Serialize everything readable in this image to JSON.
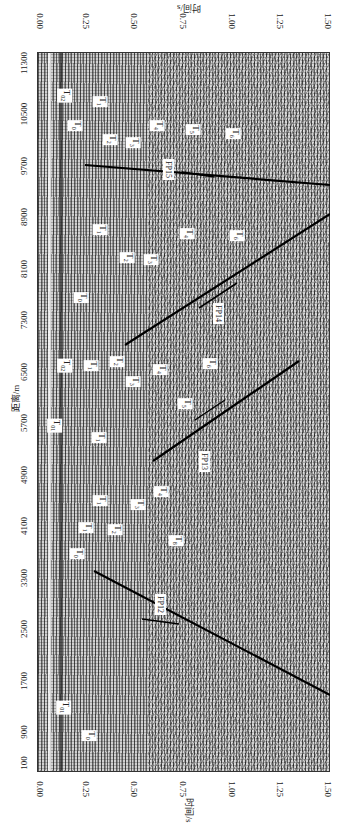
{
  "figure": {
    "x_axis": {
      "title": "距离/m",
      "ticks": [
        "11300",
        "10500",
        "9700",
        "8900",
        "8100",
        "7300",
        "6500",
        "5700",
        "4900",
        "4100",
        "3300",
        "2500",
        "1700",
        "900",
        "100"
      ]
    },
    "y_axis": {
      "title": "时间/s",
      "ticks": [
        "0.00",
        "0.25",
        "0.50",
        "0.75",
        "1.00",
        "1.25",
        "1.50"
      ]
    },
    "faults": [
      "FP15",
      "FP14",
      "FP13",
      "FP12"
    ],
    "horizons": [
      {
        "text": "T",
        "sub": "02",
        "x": 58,
        "y": 88
      },
      {
        "text": "T",
        "sub": "0",
        "x": 70,
        "y": 118
      },
      {
        "text": "T",
        "sub": "1",
        "x": 95,
        "y": 94
      },
      {
        "text": "T",
        "sub": "2",
        "x": 105,
        "y": 132
      },
      {
        "text": "T",
        "sub": "3",
        "x": 128,
        "y": 135
      },
      {
        "text": "T",
        "sub": "4",
        "x": 152,
        "y": 118
      },
      {
        "text": "T",
        "sub": "5",
        "x": 188,
        "y": 122
      },
      {
        "text": "T",
        "sub": "6",
        "x": 228,
        "y": 126
      },
      {
        "text": "T",
        "sub": "1",
        "x": 95,
        "y": 222
      },
      {
        "text": "T",
        "sub": "2",
        "x": 122,
        "y": 250
      },
      {
        "text": "T",
        "sub": "3",
        "x": 146,
        "y": 252
      },
      {
        "text": "T",
        "sub": "4",
        "x": 182,
        "y": 226
      },
      {
        "text": "T",
        "sub": "6",
        "x": 232,
        "y": 228
      },
      {
        "text": "T",
        "sub": "0",
        "x": 76,
        "y": 290
      },
      {
        "text": "T",
        "sub": "02",
        "x": 58,
        "y": 358
      },
      {
        "text": "T",
        "sub": "1",
        "x": 86,
        "y": 358
      },
      {
        "text": "T",
        "sub": "2",
        "x": 112,
        "y": 354
      },
      {
        "text": "T",
        "sub": "3",
        "x": 128,
        "y": 374
      },
      {
        "text": "T",
        "sub": "4",
        "x": 155,
        "y": 362
      },
      {
        "text": "T",
        "sub": "6",
        "x": 205,
        "y": 356
      },
      {
        "text": "T",
        "sub": "5",
        "x": 180,
        "y": 396
      },
      {
        "text": "T",
        "sub": "01",
        "x": 48,
        "y": 418
      },
      {
        "text": "T",
        "sub": "1",
        "x": 94,
        "y": 430
      },
      {
        "text": "T",
        "sub": "1",
        "x": 95,
        "y": 493
      },
      {
        "text": "T",
        "sub": "1",
        "x": 81,
        "y": 520
      },
      {
        "text": "T",
        "sub": "2",
        "x": 110,
        "y": 522
      },
      {
        "text": "T",
        "sub": "3",
        "x": 133,
        "y": 497
      },
      {
        "text": "T",
        "sub": "4",
        "x": 156,
        "y": 484
      },
      {
        "text": "T",
        "sub": "8",
        "x": 171,
        "y": 533
      },
      {
        "text": "T",
        "sub": "0",
        "x": 72,
        "y": 546
      },
      {
        "text": "T",
        "sub": "01",
        "x": 57,
        "y": 700
      },
      {
        "text": "T",
        "sub": "0",
        "x": 84,
        "y": 728
      }
    ],
    "fault_labels": [
      {
        "name": "FP15",
        "x": 166,
        "y": 162
      },
      {
        "name": "FP14",
        "x": 218,
        "y": 305
      },
      {
        "name": "FP13",
        "x": 204,
        "y": 454
      },
      {
        "name": "FP12",
        "x": 160,
        "y": 597
      }
    ]
  }
}
